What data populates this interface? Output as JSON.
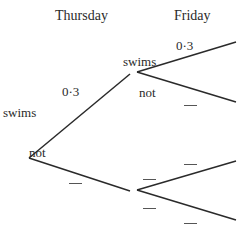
{
  "headers": {
    "thursday": "Thursday",
    "friday": "Friday"
  },
  "thursday": {
    "swims_label": "swims",
    "not_label": "not",
    "swims_prob": "0·3",
    "not_prob": "—"
  },
  "friday_after_swims": {
    "swims_label": "swims",
    "not_label": "not",
    "swims_prob": "0·3",
    "not_prob": "—"
  },
  "friday_after_not": {
    "swims_prob": "—",
    "not_prob": "—",
    "node_top_blank": "—",
    "node_bottom_blank": "—"
  },
  "colors": {
    "line": "#2a2a2a",
    "text": "#2a2a2a"
  }
}
